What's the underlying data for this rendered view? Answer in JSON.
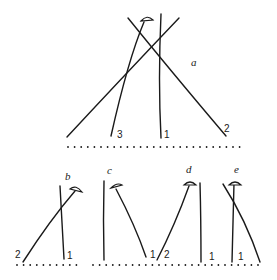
{
  "figure": {
    "panels": [
      {
        "id": "a",
        "label": "a",
        "line_labels": [
          "3",
          "1",
          "2"
        ]
      },
      {
        "id": "b",
        "label": "b",
        "line_labels": [
          "2",
          "1"
        ]
      },
      {
        "id": "c",
        "label": "c",
        "line_labels": [
          "1"
        ]
      },
      {
        "id": "d",
        "label": "d",
        "line_labels": [
          "2",
          "1"
        ]
      },
      {
        "id": "e",
        "label": "e",
        "line_labels": [
          "1"
        ]
      }
    ]
  },
  "colors": {
    "ink": "#1a1a1a",
    "background": "#ffffff"
  }
}
